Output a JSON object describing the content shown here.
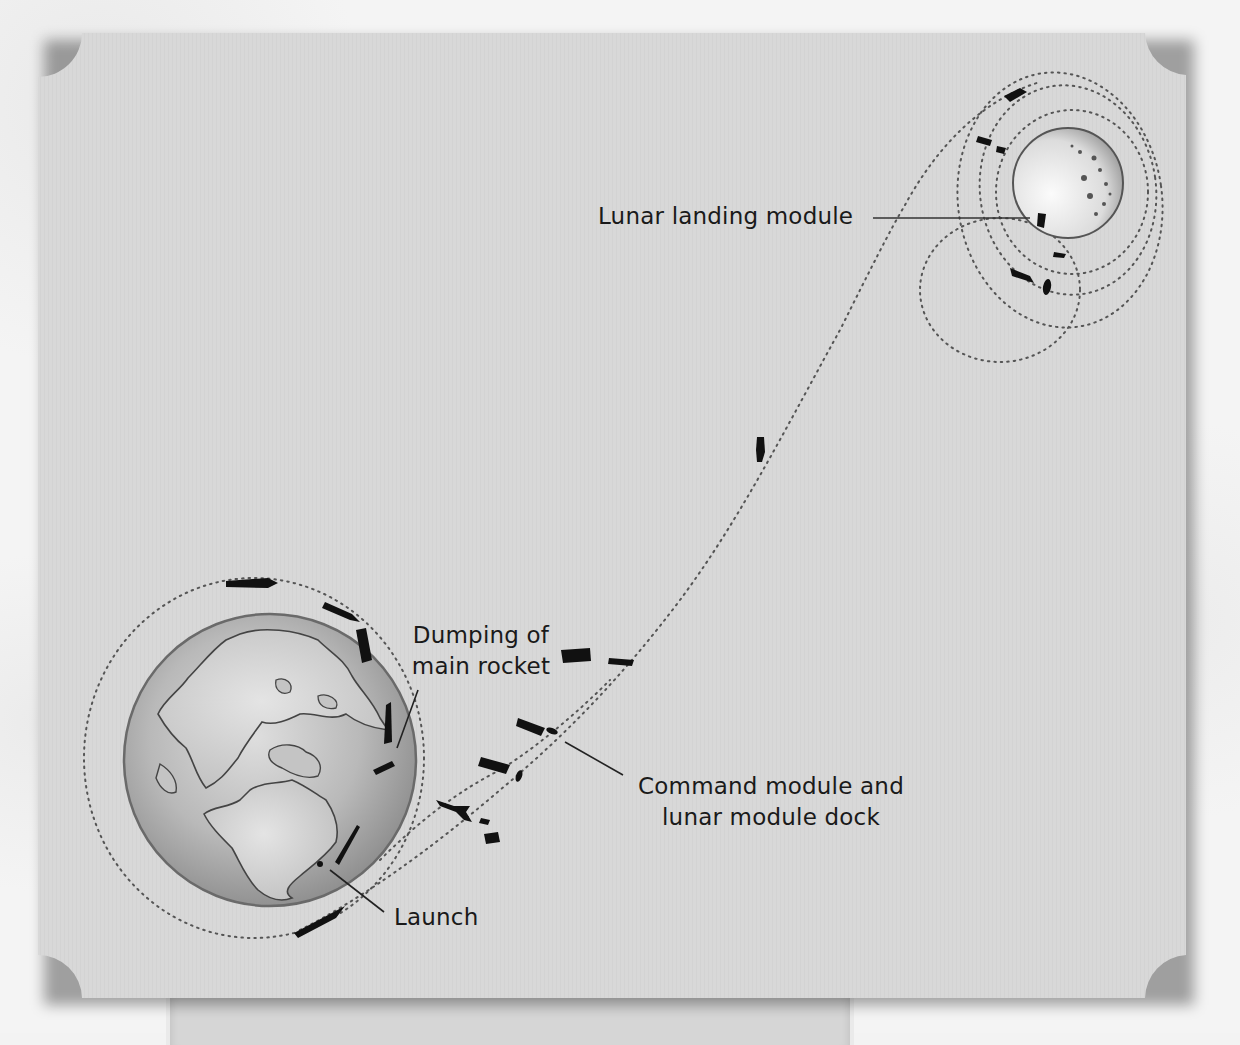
{
  "diagram": {
    "labels": {
      "lunar_landing_module": "Lunar landing module",
      "dumping_main_rocket_line1": "Dumping of",
      "dumping_main_rocket_line2": "main rocket",
      "command_module_dock_line1": "Command module and",
      "command_module_dock_line2": "lunar module dock",
      "launch": "Launch"
    },
    "nodes": [
      {
        "id": "earth",
        "label": "Earth",
        "shape": "globe",
        "center": [
          272,
          760
        ],
        "radius": 150
      },
      {
        "id": "moon",
        "label": "Moon",
        "shape": "sphere",
        "center": [
          1068,
          183
        ],
        "radius": 55
      },
      {
        "id": "earth-parking-orbit",
        "label": "Earth parking orbit",
        "shape": "dotted-ellipse"
      },
      {
        "id": "translunar-path",
        "label": "Translunar trajectory",
        "shape": "dotted-curve"
      },
      {
        "id": "lunar-orbits",
        "label": "Lunar orbits",
        "shape": "dotted-ellipses"
      }
    ],
    "stages": [
      {
        "id": "launch",
        "label": "Launch"
      },
      {
        "id": "dumping",
        "label": "Dumping of main rocket"
      },
      {
        "id": "docking",
        "label": "Command module and lunar module dock"
      },
      {
        "id": "lunar-landing",
        "label": "Lunar landing module"
      }
    ],
    "colors": {
      "card": "#d9d9d9",
      "page": "#f3f3f3",
      "ink": "#111111",
      "earth_land": "#c9c9c9",
      "earth_sea": "#a6a6a6",
      "moon": "#e6e6e6"
    }
  }
}
